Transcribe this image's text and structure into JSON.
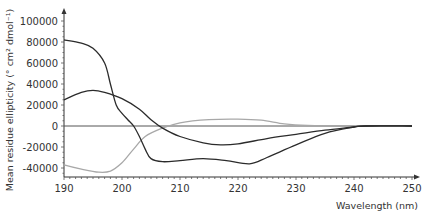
{
  "chart_data": {
    "type": "line",
    "title": "",
    "xlabel": "Wavelength (nm)",
    "ylabel": "Mean residue ellipticity (° cm² dmol⁻¹)",
    "xlim": [
      190,
      250
    ],
    "ylim": [
      -48000,
      105000
    ],
    "x_ticks": [
      190,
      200,
      210,
      220,
      230,
      240,
      250
    ],
    "y_ticks": [
      100000,
      80000,
      60000,
      40000,
      20000,
      0,
      -20000,
      -40000
    ],
    "grid": false,
    "legend": null,
    "series": [
      {
        "name": "curve-dark-1",
        "color": "#2b2b2b",
        "x": [
          190,
          193,
          195,
          197,
          198,
          199,
          200,
          201,
          202,
          203,
          204,
          205,
          207,
          210,
          214,
          218,
          222,
          225,
          230,
          235,
          240,
          242,
          250
        ],
        "values": [
          82000,
          79000,
          74000,
          60000,
          40000,
          20000,
          12000,
          6000,
          0,
          -10000,
          -22000,
          -31000,
          -34000,
          -33000,
          -31000,
          -33000,
          -36000,
          -30000,
          -18000,
          -7000,
          -1000,
          0,
          0
        ]
      },
      {
        "name": "curve-dark-2",
        "color": "#2b2b2b",
        "x": [
          190,
          193,
          195,
          197,
          200,
          203,
          205,
          207,
          210,
          214,
          217,
          220,
          225,
          230,
          235,
          240,
          242,
          250
        ],
        "values": [
          25000,
          32000,
          34000,
          32000,
          26000,
          16000,
          6000,
          -2000,
          -10000,
          -16000,
          -18000,
          -17000,
          -12000,
          -8000,
          -4000,
          -1000,
          0,
          0
        ]
      },
      {
        "name": "curve-grey",
        "color": "#a8a8a8",
        "x": [
          190,
          193,
          196,
          198,
          200,
          202,
          204,
          207,
          210,
          215,
          220,
          224,
          228,
          232,
          240,
          250
        ],
        "values": [
          -37000,
          -41000,
          -44000,
          -43000,
          -35000,
          -22000,
          -10000,
          -2000,
          3000,
          6000,
          6500,
          5500,
          2000,
          500,
          0,
          0
        ]
      },
      {
        "name": "zero-line",
        "color": "#555555",
        "x": [
          190,
          250
        ],
        "values": [
          0,
          0
        ]
      }
    ]
  }
}
